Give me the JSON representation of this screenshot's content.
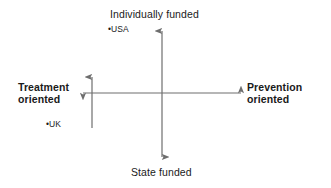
{
  "diagram": {
    "type": "two-axis-positioning-matrix",
    "line_color": "#6e6e6e",
    "text_color": "#1a1a1a",
    "background_color": "#ffffff",
    "axes": {
      "vertical": {
        "top_label": "Individually funded",
        "bottom_label": "State funded",
        "x_position": 162,
        "top_y": 30,
        "bottom_y": 158,
        "arrowheads": "both"
      },
      "horizontal": {
        "left_label_line1": "Treatment",
        "left_label_line2": "oriented",
        "right_label_line1": "Prevention",
        "right_label_line2": "oriented",
        "y_position": 93,
        "left_x": 82,
        "right_x": 242,
        "arrowheads": "both"
      },
      "secondary_vertical": {
        "x_position": 92,
        "top_y": 76,
        "bottom_y": 128,
        "arrowheads": "top"
      }
    },
    "points": [
      {
        "label": "•USA",
        "name": "usa",
        "quadrant": "upper-left",
        "x": 110,
        "y": 30
      },
      {
        "label": "•UK",
        "name": "uk",
        "quadrant": "lower-left",
        "x": 48,
        "y": 125
      }
    ]
  }
}
